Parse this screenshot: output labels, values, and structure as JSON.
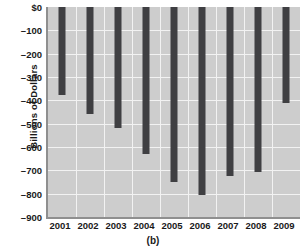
{
  "chart_data": {
    "type": "bar",
    "title": "",
    "subtitle": "",
    "xlabel": "",
    "ylabel": "Billions of Dollars",
    "categories": [
      "2001",
      "2002",
      "2003",
      "2004",
      "2005",
      "2006",
      "2007",
      "2008",
      "2009"
    ],
    "values": [
      -378,
      -458,
      -520,
      -630,
      -748,
      -805,
      -725,
      -705,
      -413
    ],
    "series": [
      {
        "name": "Federal budget deficit",
        "values": [
          -378,
          -458,
          -520,
          -630,
          -748,
          -805,
          -725,
          -705,
          -413
        ]
      }
    ],
    "ylim": [
      -900,
      0
    ],
    "ytick_values": [
      0,
      -100,
      -200,
      -300,
      -400,
      -500,
      -600,
      -700,
      -800,
      -900
    ],
    "ytick_labels": [
      "$0",
      "–100",
      "–200",
      "–300",
      "–400",
      "–500",
      "–600",
      "–700",
      "–800",
      "–900"
    ],
    "grid": true,
    "legend": "none",
    "bar_color": "#3f3f42",
    "plot_background": "#cdcdcd",
    "gridline_color": "#f2f2f2",
    "axis_color": "#8f8f8f"
  },
  "caption": {
    "text": "(b)"
  }
}
